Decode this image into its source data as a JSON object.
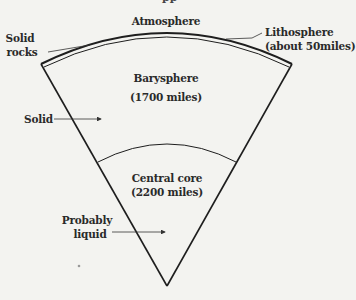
{
  "diagram": {
    "title_fragment": "pp",
    "layers": [
      {
        "name": "Atmosphere"
      },
      {
        "name": "Lithosphere",
        "thickness": "(about 50miles)"
      },
      {
        "name": "Barysphere",
        "thickness": "(1700 miles)"
      },
      {
        "name": "Central core",
        "thickness": "(2200 miles)"
      }
    ],
    "annotations": {
      "solid_rocks": [
        "Solid",
        "rocks"
      ],
      "solid": "Solid",
      "probably_liquid": [
        "Probably",
        "liquid"
      ]
    },
    "colors": {
      "line": "#1e1e1e",
      "background": "#f3f3f0"
    }
  }
}
